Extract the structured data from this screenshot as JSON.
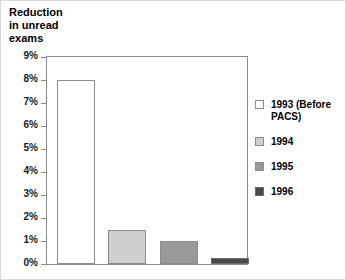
{
  "chart_data": {
    "type": "bar",
    "title": "Reduction\nin unread\nexams",
    "xlabel": "",
    "ylabel": "",
    "ylim": [
      0,
      9
    ],
    "ytick_values": [
      0,
      1,
      2,
      3,
      4,
      5,
      6,
      7,
      8,
      9
    ],
    "ytick_labels": [
      "0%",
      "1%",
      "2%",
      "3%",
      "4%",
      "5%",
      "6%",
      "7%",
      "8%",
      "9%"
    ],
    "grid": false,
    "legend_position": "right",
    "categories": [
      "1993 (Before PACS)",
      "1994",
      "1995",
      "1996"
    ],
    "values": [
      8,
      1.5,
      1,
      0.25
    ],
    "bars": [
      {
        "label": "1993 (Before\nPACS)",
        "value": 8,
        "fill": "#ffffff",
        "stroke": "#8c8c8c"
      },
      {
        "label": "1994",
        "value": 1.5,
        "fill": "#cfcfcf",
        "stroke": "#8c8c8c"
      },
      {
        "label": "1995",
        "value": 1,
        "fill": "#999999",
        "stroke": "#8c8c8c"
      },
      {
        "label": "1996",
        "value": 0.25,
        "fill": "#4a4a4a",
        "stroke": "#6e6e6e"
      }
    ]
  },
  "colors": {
    "axis": "#8c8c8c",
    "text": "#000000",
    "background": "#ffffff",
    "series_1993": "#ffffff",
    "series_1994": "#cfcfcf",
    "series_1995": "#999999",
    "series_1996": "#4a4a4a"
  }
}
